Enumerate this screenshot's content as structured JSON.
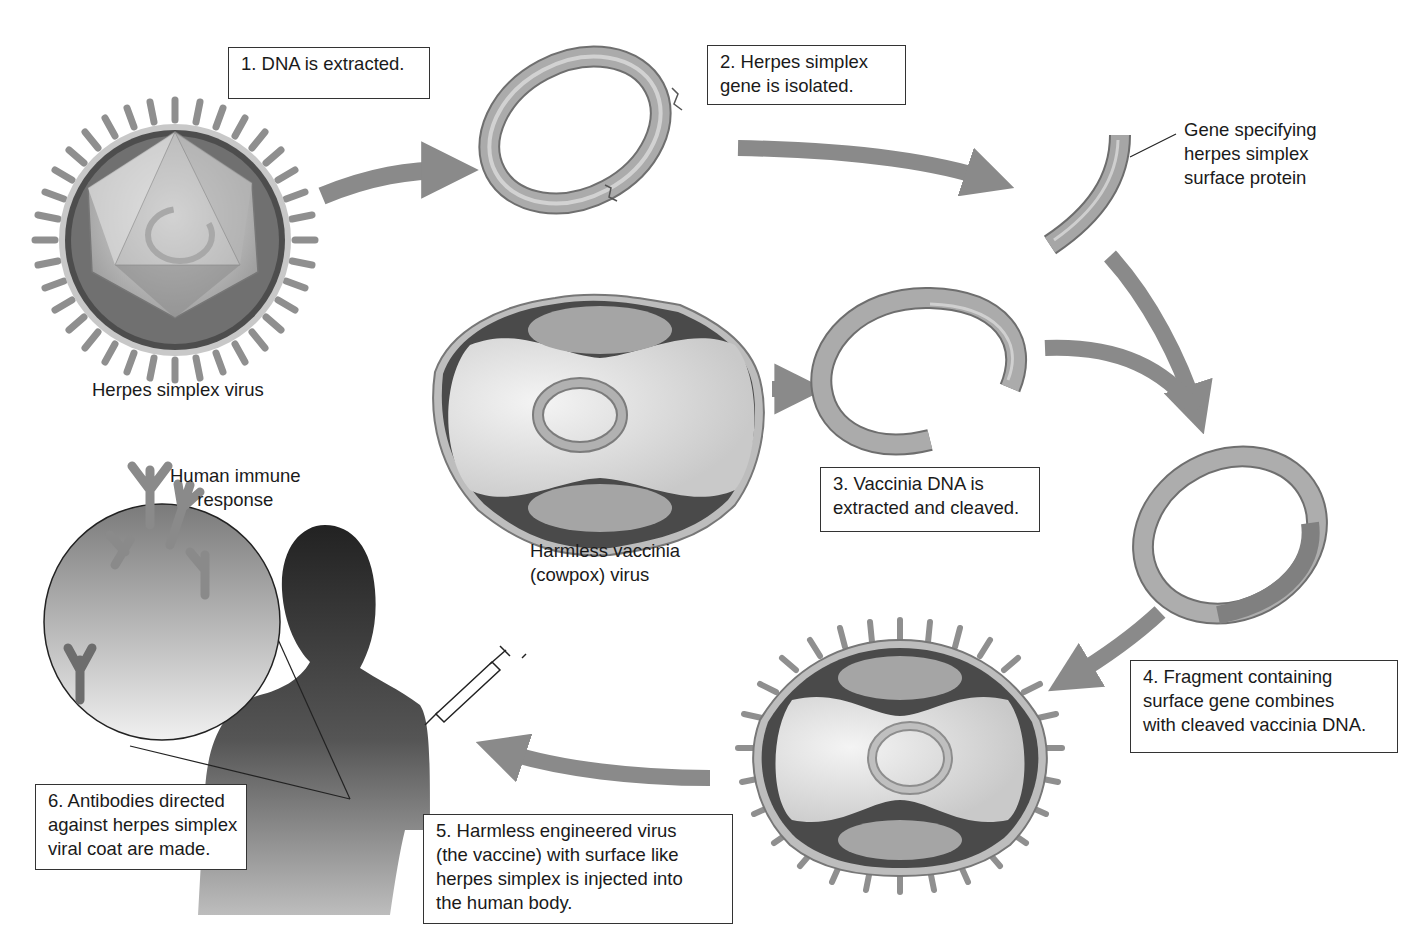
{
  "diagram": {
    "type": "process-flow",
    "colors": {
      "arrow": "#8a8a8a",
      "dna_ring": "#a9a9a9",
      "virus_capsule_dark": "#4a4a4a",
      "virus_body_light": "#d9d9d9",
      "human_silhouette": "#3a3a3a",
      "box_border": "#333333",
      "text": "#1a1a1a"
    },
    "steps": [
      {
        "id": 1,
        "lines": [
          "1. DNA is extracted."
        ]
      },
      {
        "id": 2,
        "lines": [
          "2. Herpes simplex",
          "gene is isolated."
        ]
      },
      {
        "id": 3,
        "lines": [
          "3. Vaccinia DNA is",
          "extracted and cleaved."
        ]
      },
      {
        "id": 4,
        "lines": [
          "4. Fragment containing",
          "surface gene combines",
          "with cleaved vaccinia DNA."
        ]
      },
      {
        "id": 5,
        "lines": [
          "5. Harmless engineered virus",
          "(the vaccine) with surface like",
          "herpes simplex is injected into",
          "the human body."
        ]
      },
      {
        "id": 6,
        "lines": [
          "6. Antibodies directed",
          "against herpes simplex",
          "viral coat are made."
        ]
      }
    ],
    "labels": {
      "herpes_virus": "Herpes simplex virus",
      "vaccinia_virus": [
        "Harmless vaccinia",
        "(cowpox) virus"
      ],
      "gene_fragment": [
        "Gene specifying",
        "herpes simplex",
        "surface protein"
      ],
      "immune_response": [
        "Human immune",
        "response"
      ]
    }
  }
}
